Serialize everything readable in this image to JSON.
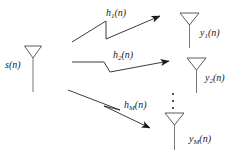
{
  "figure": {
    "type": "block-diagram",
    "background_color": "#ffffff",
    "line_color": "#1a1a1a"
  },
  "source": {
    "label_base": "s",
    "label_sub": "",
    "label_arg": "(n)",
    "label_full": "s(n)",
    "icon": "antenna-icon"
  },
  "channels": [
    {
      "label_base": "h",
      "label_sub": "1",
      "label_arg": "(n)",
      "label_full": "h1(n)",
      "name": "channel-h1"
    },
    {
      "label_base": "h",
      "label_sub": "2",
      "label_arg": "(n)",
      "label_full": "h2(n)",
      "name": "channel-h2"
    },
    {
      "label_base": "h",
      "label_sub": "M",
      "label_arg": "(n)",
      "label_full": "hM(n)",
      "name": "channel-hM"
    }
  ],
  "receivers": [
    {
      "label_base": "y",
      "label_sub": "1",
      "label_arg": "(n)",
      "label_full": "y1(n)",
      "icon": "antenna-icon",
      "name": "receiver-y1"
    },
    {
      "label_base": "y",
      "label_sub": "2",
      "label_arg": "(n)",
      "label_full": "y2(n)",
      "icon": "antenna-icon",
      "name": "receiver-y2"
    },
    {
      "label_base": "y",
      "label_sub": "M",
      "label_arg": "(n)",
      "label_full": "yM(n)",
      "icon": "antenna-icon",
      "name": "receiver-yM"
    }
  ],
  "ellipsis": {
    "glyph": "vertical-ellipsis",
    "dot_count": 3
  }
}
